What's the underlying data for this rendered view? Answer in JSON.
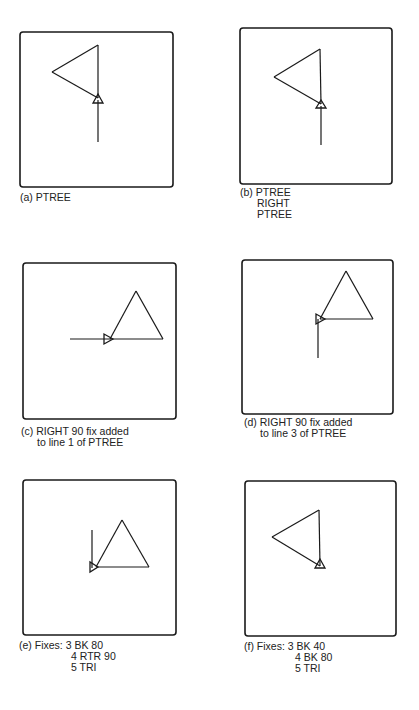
{
  "figure": {
    "panels": [
      {
        "id": "a",
        "caption_lines": [
          "(a) PTREE"
        ],
        "box": {
          "x": 20,
          "y": 32,
          "w": 153,
          "h": 155
        },
        "lines": [
          [
            98,
            45,
            52,
            72
          ],
          [
            52,
            72,
            98,
            98
          ],
          [
            98,
            98,
            98,
            45
          ],
          [
            98,
            100,
            98,
            142
          ]
        ],
        "turtle": {
          "x": 98,
          "y": 100,
          "dir": "up"
        }
      },
      {
        "id": "b",
        "caption_lines": [
          "(b) PTREE",
          "RIGHT",
          "PTREE"
        ],
        "box": {
          "x": 240,
          "y": 28,
          "w": 152,
          "h": 156
        },
        "lines": [
          [
            320,
            49,
            274,
            77
          ],
          [
            274,
            77,
            321,
            104
          ],
          [
            321,
            104,
            320,
            49
          ],
          [
            321,
            106,
            321,
            145
          ]
        ],
        "turtle": {
          "x": 321,
          "y": 106,
          "dir": "up"
        }
      },
      {
        "id": "c",
        "caption_lines": [
          "(c) RIGHT 90 fix added",
          "to line 1 of PTREE"
        ],
        "box": {
          "x": 23,
          "y": 263,
          "w": 153,
          "h": 156
        },
        "lines": [
          [
            136,
            291,
            163,
            339
          ],
          [
            163,
            339,
            110,
            339
          ],
          [
            110,
            339,
            136,
            291
          ],
          [
            70,
            339,
            110,
            339
          ]
        ],
        "turtle": {
          "x": 108,
          "y": 339,
          "dir": "right"
        }
      },
      {
        "id": "d",
        "caption_lines": [
          "(d) RIGHT 90 fix added",
          "to line 3 of PTREE"
        ],
        "box": {
          "x": 242,
          "y": 260,
          "w": 151,
          "h": 154
        },
        "lines": [
          [
            346,
            271,
            373,
            319
          ],
          [
            373,
            319,
            320,
            319
          ],
          [
            320,
            319,
            346,
            271
          ],
          [
            318,
            319,
            318,
            358
          ]
        ],
        "turtle": {
          "x": 319,
          "y": 319,
          "dir": "right"
        }
      },
      {
        "id": "e",
        "caption_lines": [
          "(e) Fixes: 3 BK 80",
          "4 RTR 90",
          "5 TRI"
        ],
        "box": {
          "x": 23,
          "y": 480,
          "w": 153,
          "h": 155
        },
        "lines": [
          [
            122,
            520,
            149,
            567
          ],
          [
            149,
            567,
            96,
            567
          ],
          [
            96,
            567,
            122,
            520
          ],
          [
            92,
            530,
            92,
            568
          ]
        ],
        "turtle": {
          "x": 93,
          "y": 567,
          "dir": "right"
        }
      },
      {
        "id": "f",
        "caption_lines": [
          "(f)  Fixes: 3 BK 40",
          "4 BK 80",
          "5 TRI"
        ],
        "box": {
          "x": 245,
          "y": 481,
          "w": 151,
          "h": 155
        },
        "lines": [
          [
            319,
            510,
            272,
            537
          ],
          [
            272,
            537,
            320,
            566
          ],
          [
            320,
            566,
            319,
            510
          ]
        ],
        "turtle": {
          "x": 320,
          "y": 566,
          "dir": "up"
        }
      }
    ]
  }
}
